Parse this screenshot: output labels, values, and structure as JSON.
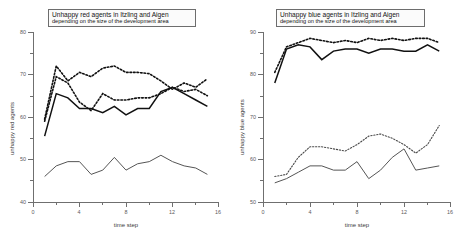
{
  "figure": {
    "panels": [
      {
        "id": "left",
        "title_line1": "Unhappy red agents in Itzling and Aigen",
        "title_line2": "depending on the size of the development area",
        "xlabel": "time step",
        "ylabel": "unhappy red agents",
        "yticks": [
          "80",
          "70",
          "60",
          "50",
          "40"
        ],
        "xticks": [
          "0",
          "4",
          "8",
          "12",
          "16"
        ]
      },
      {
        "id": "right",
        "title_line1": "Unhappy blue agents in Itzling and Aigen",
        "title_line2": "depending on the size of the development area",
        "xlabel": "time step",
        "ylabel": "unhappy blue agents",
        "yticks": [
          "90",
          "80",
          "70",
          "60",
          "50"
        ],
        "xticks": [
          "0",
          "4",
          "8",
          "12",
          "16"
        ]
      }
    ]
  },
  "chart_data": [
    {
      "type": "line",
      "title": "Unhappy red agents in Itzling and Aigen depending on the size of the development area",
      "xlabel": "time step",
      "ylabel": "unhappy red agents",
      "xlim": [
        0,
        16
      ],
      "ylim": [
        40,
        80
      ],
      "xticks": [
        0,
        4,
        8,
        12,
        16
      ],
      "yticks": [
        40,
        50,
        60,
        70,
        80
      ],
      "grid": false,
      "legend": "none",
      "x": [
        1,
        2,
        3,
        4,
        5,
        6,
        7,
        8,
        9,
        10,
        11,
        12,
        13,
        14,
        15
      ],
      "series": [
        {
          "name": "red agents upper dotted",
          "style": "dotted",
          "values": [
            59.5,
            72.0,
            68.5,
            70.5,
            69.5,
            71.5,
            72.0,
            70.5,
            70.5,
            70.2,
            68.5,
            66.5,
            68.0,
            67.0,
            69.0
          ]
        },
        {
          "name": "red agents middle dotted",
          "style": "dotted",
          "values": [
            59.0,
            69.5,
            68.0,
            63.5,
            61.5,
            65.5,
            64.0,
            64.0,
            64.5,
            64.5,
            65.5,
            67.0,
            66.0,
            66.5,
            65.0
          ]
        },
        {
          "name": "red agents solid upper",
          "style": "solid",
          "values": [
            55.5,
            65.5,
            64.5,
            62.0,
            62.0,
            61.0,
            62.5,
            60.5,
            62.0,
            62.0,
            66.0,
            67.0,
            65.5,
            64.0,
            62.5
          ]
        },
        {
          "name": "red agents solid lower",
          "style": "solid",
          "values": [
            46.0,
            48.5,
            49.5,
            49.5,
            46.5,
            47.5,
            50.5,
            47.5,
            49.0,
            49.5,
            51.0,
            49.5,
            48.5,
            48.0,
            46.5
          ]
        }
      ]
    },
    {
      "type": "line",
      "title": "Unhappy blue agents in Itzling and Aigen depending on the size of the development area",
      "xlabel": "time step",
      "ylabel": "unhappy blue agents",
      "xlim": [
        0,
        16
      ],
      "ylim": [
        50,
        90
      ],
      "xticks": [
        0,
        4,
        8,
        12,
        16
      ],
      "yticks": [
        50,
        60,
        70,
        80,
        90
      ],
      "grid": false,
      "legend": "none",
      "x": [
        1,
        2,
        3,
        4,
        5,
        6,
        7,
        8,
        9,
        10,
        11,
        12,
        13,
        14,
        15
      ],
      "series": [
        {
          "name": "blue agents upper dotted",
          "style": "dotted",
          "values": [
            80.5,
            86.5,
            87.5,
            88.5,
            88.0,
            87.5,
            88.0,
            87.5,
            88.5,
            88.0,
            88.5,
            88.0,
            88.5,
            88.5,
            87.5
          ]
        },
        {
          "name": "blue agents solid upper",
          "style": "solid",
          "values": [
            78.0,
            86.0,
            87.0,
            86.5,
            83.5,
            85.5,
            86.0,
            86.0,
            85.0,
            86.0,
            86.0,
            85.5,
            85.5,
            87.0,
            85.5
          ]
        },
        {
          "name": "blue agents lower dotted",
          "style": "dotted",
          "values": [
            56.0,
            56.5,
            60.5,
            63.0,
            63.0,
            62.5,
            62.0,
            63.5,
            65.5,
            66.0,
            65.0,
            63.5,
            61.5,
            63.5,
            68.0
          ]
        },
        {
          "name": "blue agents solid lower",
          "style": "solid",
          "values": [
            54.5,
            55.5,
            57.0,
            58.5,
            58.5,
            57.5,
            57.5,
            59.5,
            55.5,
            57.5,
            60.5,
            62.5,
            57.5,
            58.0,
            58.5
          ]
        }
      ]
    }
  ]
}
